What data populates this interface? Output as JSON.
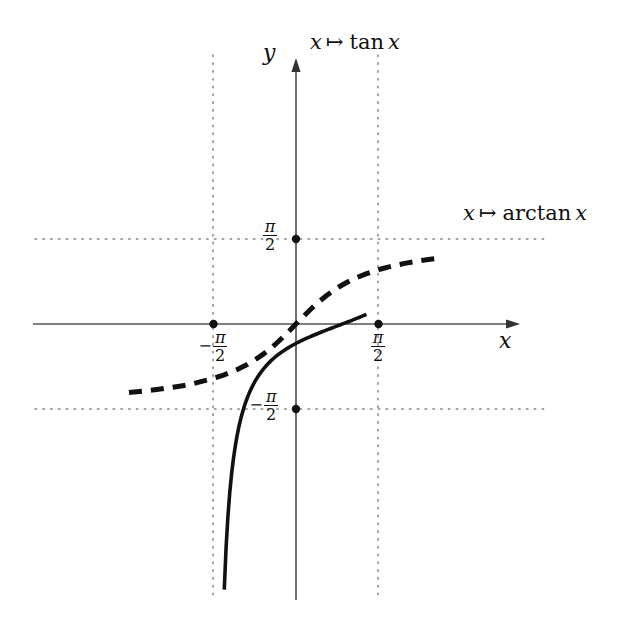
{
  "figure": {
    "title": "",
    "background_color": "#ffffff",
    "ink_color": "#111111",
    "axis_color": "#555555",
    "guide_color": "#888888"
  },
  "axes": {
    "x_axis_label": "x",
    "y_axis_label": "y",
    "x_axis_name": "x-axis",
    "y_axis_name": "y-axis"
  },
  "labels": {
    "tan_curve": {
      "variable": "x",
      "mapsto": "↦",
      "function": "tan",
      "argument": "x",
      "full": "x ↦ tan x"
    },
    "arctan_curve": {
      "variable": "x",
      "mapsto": "↦",
      "function": "arctan",
      "argument": "x",
      "full": "x ↦ arctan x"
    }
  },
  "ticks": {
    "x": [
      {
        "id": "x-neg-half-pi",
        "sign": "−",
        "numerator": "π",
        "denominator": "2",
        "value": -1.5707963,
        "display": "−π/2"
      },
      {
        "id": "x-pos-half-pi",
        "sign": "",
        "numerator": "π",
        "denominator": "2",
        "value": 1.5707963,
        "display": "π/2"
      }
    ],
    "y": [
      {
        "id": "y-pos-half-pi",
        "sign": "",
        "numerator": "π",
        "denominator": "2",
        "value": 1.5707963,
        "display": "π/2"
      },
      {
        "id": "y-neg-half-pi",
        "sign": "−",
        "numerator": "π",
        "denominator": "2",
        "value": -1.5707963,
        "display": "−π/2"
      }
    ]
  },
  "chart_data": {
    "type": "line",
    "title": "",
    "xlabel": "x",
    "ylabel": "y",
    "grid": false,
    "legend_position": "inline-annotations",
    "xlim": [
      -3.18,
      2.73
    ],
    "ylim": [
      -4.91,
      4.91
    ],
    "x_tick_values": [
      -1.5707963,
      1.5707963
    ],
    "x_tick_labels": [
      "−π/2",
      "π/2"
    ],
    "y_tick_values": [
      -1.5707963,
      1.5707963
    ],
    "y_tick_labels": [
      "−π/2",
      "π/2"
    ],
    "asymptotes": {
      "vertical": [
        -1.5707963,
        1.5707963
      ],
      "horizontal": [
        -1.5707963,
        1.5707963
      ]
    },
    "marked_points": [
      {
        "x": -1.5707963,
        "y": 0
      },
      {
        "x": 1.5707963,
        "y": 0
      },
      {
        "x": 0,
        "y": 1.5707963
      },
      {
        "x": 0,
        "y": -1.5707963
      }
    ],
    "series": [
      {
        "name": "x ↦ tan x",
        "style": "solid",
        "linewidth": 3.6,
        "color": "#111111",
        "x": [
          -1.3655,
          -1.3308,
          -1.2961,
          -1.2614,
          -1.2267,
          -1.192,
          -1.1573,
          -1.1226,
          -1.0879,
          -1.0532,
          -1.0185,
          -0.9838,
          -0.9491,
          -0.9144,
          -0.8797,
          -0.845,
          -0.8103,
          -0.7756,
          -0.7409,
          -0.7062,
          -0.6715,
          -0.6368,
          -0.6021,
          -0.5674,
          -0.5327,
          -0.498,
          -0.4633,
          -0.4286,
          -0.3939,
          -0.3592,
          -0.3245,
          -0.2898,
          -0.2551,
          -0.2204,
          -0.1857,
          -0.151,
          -0.1163,
          -0.0816,
          -0.0469,
          -0.0122,
          0.0225,
          0.0572,
          0.0919,
          0.1266,
          0.1613,
          0.196,
          0.2307,
          0.2654,
          0.3001,
          0.3348,
          0.3695,
          0.4042,
          0.4389,
          0.4736,
          0.5083,
          0.543,
          0.5777,
          0.6124,
          0.6471,
          0.6818,
          0.7165,
          0.7512,
          0.7859,
          0.8206,
          0.8553,
          0.89,
          0.9247,
          0.9594,
          0.9941,
          1.0288,
          1.0635,
          1.0982,
          1.1329,
          1.1676,
          1.2023,
          1.237,
          1.2717,
          1.3064,
          1.3411
        ],
        "y": [
          -4.9089,
          -4.1256,
          -3.5535,
          -3.117,
          -2.7724,
          -2.4932,
          -2.2622,
          -2.0677,
          -1.9015,
          -1.7577,
          -1.6318,
          -1.5206,
          -1.4215,
          -1.3326,
          -1.2524,
          -1.1796,
          -1.1132,
          -1.0523,
          -0.9963,
          -0.9446,
          -0.8966,
          -0.8519,
          -0.8103,
          -0.7713,
          -0.7347,
          -0.7004,
          -0.668,
          -0.6374,
          -0.6085,
          -0.581,
          -0.5549,
          -0.53,
          -0.5062,
          -0.4835,
          -0.4617,
          -0.4408,
          -0.4207,
          -0.4013,
          -0.3826,
          -0.3645,
          -0.3469,
          -0.3299,
          -0.3133,
          -0.2971,
          -0.2814,
          -0.266,
          -0.2509,
          -0.2361,
          -0.2216,
          -0.2074,
          -0.1934,
          -0.1796,
          -0.166,
          -0.1525,
          -0.1392,
          -0.126,
          -0.1129,
          -0.0999,
          -0.087,
          -0.0741,
          -0.0613,
          -0.0485,
          -0.0357,
          -0.0229,
          -0.0102,
          0.0025,
          0.0152,
          0.028,
          0.0409,
          0.0538,
          0.0669,
          0.0801,
          0.0935,
          0.1071,
          0.1209,
          0.135,
          0.1494,
          0.1641,
          0.1792
        ],
        "note": "tan x on (-pi/2, pi/2); vertical asymptotes at x = +/- pi/2"
      },
      {
        "name": "x ↦ arctan x",
        "style": "dashed",
        "linewidth": 5.0,
        "dash_pattern": [
          13,
          9
        ],
        "color": "#111111",
        "x": [
          -3.18,
          -3.03,
          -2.88,
          -2.73,
          -2.58,
          -2.43,
          -2.28,
          -2.13,
          -1.98,
          -1.83,
          -1.68,
          -1.53,
          -1.38,
          -1.23,
          -1.08,
          -0.93,
          -0.78,
          -0.63,
          -0.48,
          -0.33,
          -0.18,
          -0.03,
          0.12,
          0.27,
          0.42,
          0.57,
          0.72,
          0.87,
          1.02,
          1.17,
          1.32,
          1.47,
          1.62,
          1.77,
          1.92,
          2.07,
          2.22,
          2.37,
          2.52,
          2.67,
          2.73
        ],
        "y": [
          -1.2661,
          -1.2521,
          -1.2369,
          -1.2203,
          -1.2021,
          -1.182,
          -1.1598,
          -1.1351,
          -1.1075,
          -1.0703,
          -1.034,
          -0.9915,
          -0.9437,
          -0.8881,
          -0.8238,
          -0.7491,
          -0.6624,
          -0.5622,
          -0.4473,
          -0.3189,
          -0.1781,
          -0.03,
          0.1194,
          0.2636,
          0.3977,
          0.5181,
          0.6233,
          0.7156,
          0.7948,
          0.8632,
          0.9221,
          0.973,
          1.0172,
          1.0559,
          1.0898,
          1.1197,
          1.1462,
          1.1697,
          1.1907,
          1.2096,
          1.2165
        ],
        "note": "arctan x; horizontal asymptotes at y = +/- pi/2"
      }
    ]
  }
}
